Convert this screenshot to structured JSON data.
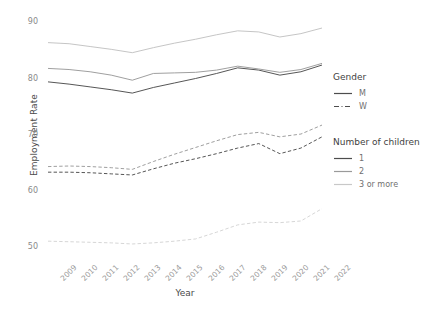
{
  "chart_data": {
    "type": "line",
    "title": "",
    "xlabel": "Year",
    "ylabel": "Employment Rate",
    "x": [
      2009,
      2010,
      2011,
      2012,
      2013,
      2014,
      2015,
      2016,
      2017,
      2018,
      2019,
      2020,
      2021,
      2022
    ],
    "xtick_labels": [
      "2009",
      "2010",
      "2011",
      "2012",
      "2013",
      "2014",
      "2015",
      "2016",
      "2017",
      "2018",
      "2019",
      "2020",
      "2021",
      "2022"
    ],
    "ytick_labels": [
      "50",
      "60",
      "70",
      "80",
      "90"
    ],
    "ytick_values": [
      50,
      60,
      70,
      80,
      90
    ],
    "ylim": [
      48.0,
      91.5
    ],
    "xlim": [
      2009,
      2022
    ],
    "grid": false,
    "legend_position": "right",
    "series": [
      {
        "name": "M, 1",
        "gender": "M",
        "children": "1",
        "linestyle": "solid",
        "color": "#4d4d4d",
        "values": [
          79.4,
          79.0,
          78.5,
          78.0,
          77.4,
          78.4,
          79.2,
          80.0,
          80.9,
          81.9,
          81.5,
          80.6,
          81.2,
          82.4
        ]
      },
      {
        "name": "M, 2",
        "gender": "M",
        "children": "2",
        "linestyle": "solid",
        "color": "#9a9a9a",
        "values": [
          81.8,
          81.6,
          81.2,
          80.6,
          79.7,
          80.9,
          81.0,
          81.1,
          81.5,
          82.2,
          81.7,
          81.1,
          81.6,
          82.7
        ]
      },
      {
        "name": "M, 3 or more",
        "gender": "M",
        "children": "3 or more",
        "linestyle": "solid",
        "color": "#c2c2c2",
        "values": [
          86.4,
          86.2,
          85.7,
          85.2,
          84.6,
          85.5,
          86.3,
          87.0,
          87.8,
          88.5,
          88.3,
          87.4,
          88.0,
          89.0
        ]
      },
      {
        "name": "W, 1",
        "gender": "W",
        "children": "1",
        "linestyle": "dashed",
        "color": "#4d4d4d",
        "values": [
          63.3,
          63.3,
          63.2,
          63.0,
          62.8,
          63.9,
          64.9,
          65.7,
          66.6,
          67.6,
          68.4,
          66.6,
          67.6,
          69.6
        ]
      },
      {
        "name": "W, 2",
        "gender": "W",
        "children": "2",
        "linestyle": "dashed",
        "color": "#9a9a9a",
        "values": [
          64.3,
          64.4,
          64.3,
          64.1,
          63.8,
          65.2,
          66.5,
          67.7,
          68.9,
          70.0,
          70.4,
          69.6,
          70.1,
          71.7
        ]
      },
      {
        "name": "W, 3 or more",
        "gender": "W",
        "children": "3 or more",
        "linestyle": "dashed",
        "color": "#d4d4d4",
        "values": [
          51.0,
          50.9,
          50.8,
          50.7,
          50.5,
          50.7,
          51.0,
          51.4,
          52.6,
          53.9,
          54.4,
          54.3,
          54.6,
          56.8
        ]
      }
    ]
  },
  "legend": {
    "gender": {
      "title": "Gender",
      "items": [
        {
          "label": "M",
          "linestyle": "solid",
          "color": "#4d4d4d"
        },
        {
          "label": "W",
          "linestyle": "dashed",
          "color": "#4d4d4d"
        }
      ]
    },
    "children": {
      "title": "Number of children",
      "items": [
        {
          "label": "1",
          "linestyle": "solid",
          "color": "#4d4d4d"
        },
        {
          "label": "2",
          "linestyle": "solid",
          "color": "#9a9a9a"
        },
        {
          "label": "3 or more",
          "linestyle": "solid",
          "color": "#c8c8c8"
        }
      ]
    }
  },
  "colors": {
    "background": "#ffffff",
    "axis_text": "#8a8a8a",
    "axis_title": "#4a4a4a"
  }
}
